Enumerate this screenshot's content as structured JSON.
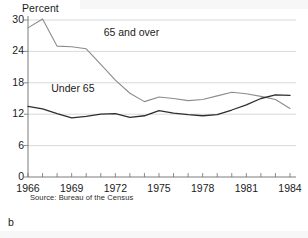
{
  "figure": {
    "label": "b",
    "source_note": "Source: Bureau of the Census"
  },
  "chart_data": {
    "type": "line",
    "title": "",
    "subtitle": "",
    "xlabel": "",
    "ylabel": "Percent",
    "xlim": [
      1966,
      1984
    ],
    "ylim": [
      0,
      30
    ],
    "yticks": [
      0,
      6,
      12,
      18,
      24,
      30
    ],
    "ytick_labels": [
      "0",
      "6",
      "12",
      "18",
      "24",
      "30"
    ],
    "xticks": [
      1966,
      1967,
      1968,
      1969,
      1970,
      1971,
      1972,
      1973,
      1974,
      1975,
      1976,
      1977,
      1978,
      1979,
      1980,
      1981,
      1982,
      1983,
      1984
    ],
    "xtick_labels": [
      "1966",
      "1969",
      "1972",
      "1975",
      "1978",
      "1981",
      "1984"
    ],
    "xtick_labeled_values": [
      1966,
      1969,
      1972,
      1975,
      1978,
      1981,
      1984
    ],
    "grid": true,
    "grid_axis": "y",
    "legend_position": "inline-annotation",
    "x": [
      1966,
      1967,
      1968,
      1969,
      1970,
      1971,
      1972,
      1973,
      1974,
      1975,
      1976,
      1977,
      1978,
      1979,
      1980,
      1981,
      1982,
      1983,
      1984
    ],
    "series": [
      {
        "name": "65 and over",
        "color": "#8c8c8c",
        "label_position": {
          "x": 1971.2,
          "y": 27.5
        },
        "values": [
          28.5,
          30.2,
          25.0,
          24.9,
          24.5,
          21.5,
          18.5,
          16.0,
          14.4,
          15.3,
          15.0,
          14.6,
          14.8,
          15.5,
          16.2,
          15.9,
          15.4,
          14.8,
          13.1
        ]
      },
      {
        "name": "Under 65",
        "color": "#2e2e2e",
        "label_position": {
          "x": 1967.6,
          "y": 16.8
        },
        "values": [
          13.5,
          13.0,
          12.1,
          11.3,
          11.6,
          12.0,
          12.1,
          11.4,
          11.7,
          12.7,
          12.2,
          11.9,
          11.7,
          11.9,
          12.8,
          13.8,
          15.0,
          15.7,
          15.6
        ]
      }
    ]
  }
}
